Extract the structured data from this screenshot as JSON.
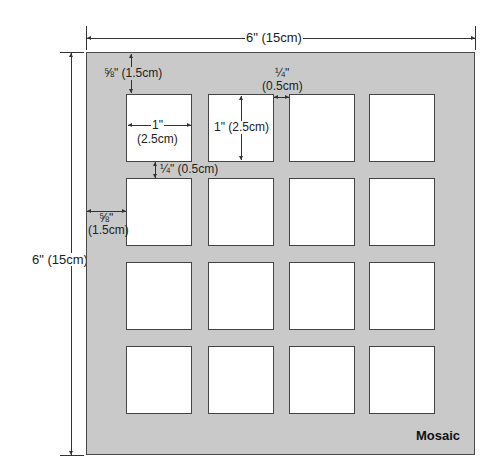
{
  "diagram": {
    "title": "Mosaic",
    "board": {
      "width_label": "6\" (15cm)",
      "height_label": "6\" (15cm)",
      "color": "#c9c9c9"
    },
    "grid": {
      "rows": 4,
      "cols": 4,
      "window_color": "#ffffff"
    },
    "dimensions": {
      "top_margin": "⅝\" (1.5cm)",
      "left_margin_line1": "⅝\"",
      "left_margin_line2": "(1.5cm)",
      "window_width_line1": "1\"",
      "window_width_line2": "(2.5cm)",
      "window_height": "1\" (2.5cm)",
      "h_gap_line1": "¼\"",
      "h_gap_line2": "(0.5cm)",
      "v_gap": "¼\" (0.5cm)"
    }
  }
}
